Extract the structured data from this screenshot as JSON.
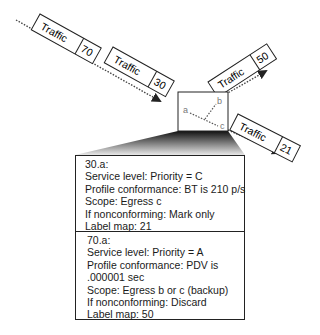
{
  "diagram": {
    "flows": [
      {
        "id": "in-70",
        "label": "Traffic",
        "value": "70"
      },
      {
        "id": "in-30",
        "label": "Traffic",
        "value": "30"
      },
      {
        "id": "out-50",
        "label": "Traffic",
        "value": "50"
      },
      {
        "id": "out-21",
        "label": "Traffic",
        "value": "21"
      }
    ],
    "router": {
      "ports": [
        "a",
        "b",
        "c"
      ]
    },
    "entries": [
      {
        "lines": [
          "30.a:",
          "Service level: Priority = C",
          "Profile conformance: BT is 210 p/s",
          "Scope: Egress c",
          "If nonconforming: Mark only",
          "Label map: 21"
        ]
      },
      {
        "lines": [
          "70.a:",
          "Service level: Priority = A",
          "Profile conformance: PDV is",
          ".000001 sec",
          "Scope: Egress b or c (backup)",
          "If nonconforming: Discard",
          "Label map: 50"
        ]
      }
    ],
    "colors": {
      "stroke": "#222222",
      "port_label": "#777777",
      "background": "#ffffff"
    }
  }
}
